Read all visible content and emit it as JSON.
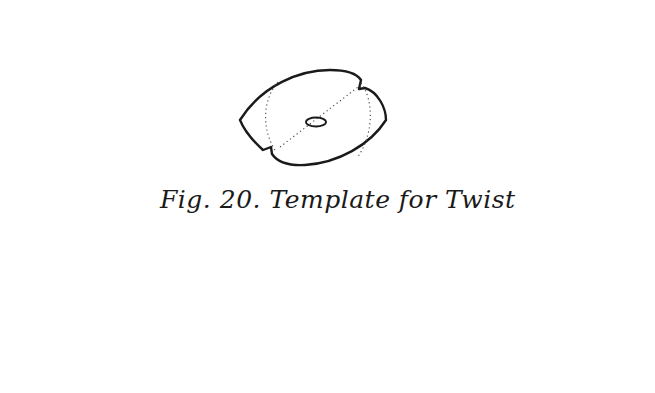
{
  "figure": {
    "caption": "Fig. 20. Template for Twist",
    "parts": {
      "template": "lens-shaped template with central hole, notched corners and dotted fold lines",
      "horizontal_twist": "horizontal chain of five interlocking twisted segments",
      "vertical_twist": "vertical twisted cord at top right with dashed hidden strand",
      "corner_turn": "dashed corner loop joining horizontal and vertical twist"
    },
    "colors": {
      "ink": "#1a1a1a",
      "paper": "#ffffff"
    }
  }
}
